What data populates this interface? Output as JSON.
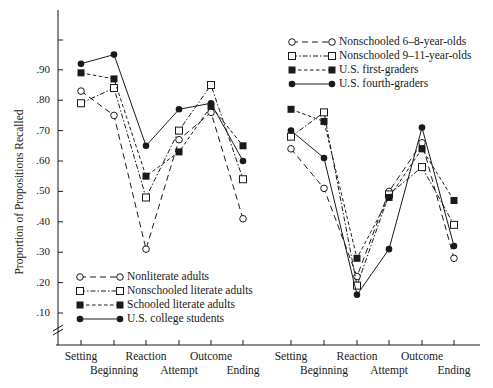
{
  "chart_data": {
    "type": "line",
    "title": "",
    "xlabel": "",
    "ylabel": "Proportion of Propositions Recalled",
    "ylim": [
      0.0,
      1.0
    ],
    "yticks": [
      ".10",
      ".20",
      ".30",
      ".40",
      ".50",
      ".60",
      ".70",
      ".80",
      ".90"
    ],
    "y_axis_break": true,
    "grid": false,
    "panels": [
      {
        "name": "adults",
        "categories": [
          "Setting",
          "Beginning",
          "Reaction",
          "Attempt",
          "Outcome",
          "Ending"
        ],
        "legend_position": "lower-left",
        "series": [
          {
            "name": "Nonliterate adults",
            "marker": "open-circle",
            "line": "long-dash",
            "values": [
              0.83,
              0.75,
              0.31,
              0.67,
              0.76,
              0.41
            ]
          },
          {
            "name": "Nonschooled literate adults",
            "marker": "open-square",
            "line": "dash-dot",
            "values": [
              0.79,
              0.84,
              0.48,
              0.7,
              0.85,
              0.54
            ]
          },
          {
            "name": "Schooled literate adults",
            "marker": "filled-square",
            "line": "short-dash",
            "values": [
              0.89,
              0.87,
              0.55,
              0.63,
              0.78,
              0.65
            ]
          },
          {
            "name": "U.S. college students",
            "marker": "filled-circle",
            "line": "solid",
            "values": [
              0.92,
              0.95,
              0.65,
              0.77,
              0.79,
              0.6
            ]
          }
        ]
      },
      {
        "name": "children",
        "categories": [
          "Setting",
          "Beginning",
          "Reaction",
          "Attempt",
          "Outcome",
          "Ending"
        ],
        "legend_position": "upper-right",
        "series": [
          {
            "name": "Nonschooled 6–8-year-olds",
            "marker": "open-circle",
            "line": "long-dash",
            "values": [
              0.64,
              0.51,
              0.22,
              0.5,
              0.66,
              0.28
            ]
          },
          {
            "name": "Nonschooled 9–11-year-olds",
            "marker": "open-square",
            "line": "dash-dot",
            "values": [
              0.68,
              0.76,
              0.19,
              0.49,
              0.58,
              0.39
            ]
          },
          {
            "name": "U.S. first-graders",
            "marker": "filled-square",
            "line": "short-dash",
            "values": [
              0.77,
              0.73,
              0.28,
              0.48,
              0.64,
              0.47
            ]
          },
          {
            "name": "U.S. fourth-graders",
            "marker": "filled-circle",
            "line": "solid",
            "values": [
              0.7,
              0.61,
              0.16,
              0.31,
              0.71,
              0.32
            ]
          }
        ]
      }
    ]
  },
  "colors": {
    "ink": "#1a1a1a",
    "background": "#ffffff"
  }
}
